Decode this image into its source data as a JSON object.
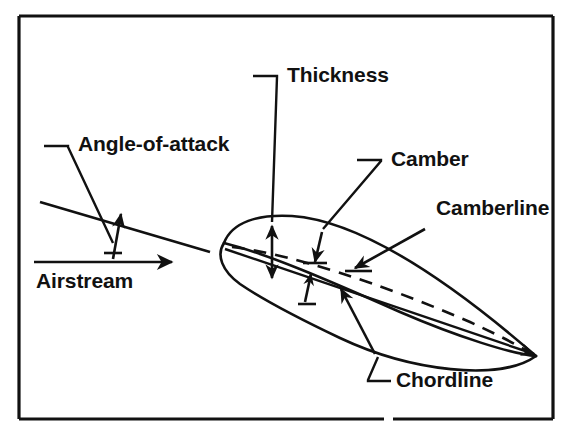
{
  "figure": {
    "background_color": "#ffffff",
    "ink_color": "#111111",
    "width": 571,
    "height": 446,
    "border": {
      "name": "figure-border",
      "x": 19,
      "y": 16,
      "width": 534,
      "height": 403,
      "stroke_width": 3.2,
      "bottom_gap_x": 384,
      "bottom_gap_width": 9
    }
  },
  "labels": {
    "angle_of_attack": {
      "text": "Angle-of-attack",
      "x": 78,
      "y": 151,
      "anchor": "start"
    },
    "airstream": {
      "text": "Airstream",
      "x": 36,
      "y": 288,
      "anchor": "start"
    },
    "thickness": {
      "text": "Thickness",
      "x": 287,
      "y": 82,
      "anchor": "start"
    },
    "camber": {
      "text": "Camber",
      "x": 391,
      "y": 166,
      "anchor": "start"
    },
    "camberline": {
      "text": "Camberline",
      "x": 436,
      "y": 215,
      "anchor": "start"
    },
    "chordline": {
      "text": "Chordline",
      "x": 396,
      "y": 387,
      "anchor": "start"
    }
  },
  "geometry": {
    "angle_of_attack_group": {
      "name": "angle-of-attack-construction",
      "inclined_chord_line": {
        "x1": 40,
        "y1": 202,
        "x2": 210,
        "y2": 252
      },
      "airstream_line": {
        "x1": 34,
        "y1": 262,
        "x2": 168,
        "y2": 262
      },
      "airstream_arrow_tip": {
        "x": 172,
        "y": 262
      },
      "angle_arrow": {
        "x1": 113,
        "y1": 259,
        "x2": 121,
        "y2": 214
      },
      "angle_arrow_base_tick": {
        "x1": 104,
        "y1": 253,
        "x2": 122,
        "y2": 253
      },
      "leader": "M 44,146 L 68,146 L 68,147 L 113,243"
    },
    "airfoil": {
      "name": "airfoil-section",
      "leading_edge": {
        "x": 224,
        "y": 243
      },
      "trailing_edge": {
        "x": 536,
        "y": 356
      },
      "upper_surface": "M 224,243 C 232,222 258,214 292,216 C 350,220 430,264 536,356",
      "nose_lower_loop": "M 224,243 C 216,255 222,271 240,284 C 262,299 300,319 340,338 C 410,371 500,382 536,356",
      "mid_body_line": "M 224,243 C 268,254 330,281 400,312 C 458,337 512,354 536,356",
      "chord_line": {
        "x1": 225,
        "y1": 249,
        "x2": 529,
        "y2": 352
      },
      "chord_arrow_tip": {
        "x": 534,
        "y": 354
      },
      "camber_line": "M 232,247 C 290,254 380,283 470,322 C 505,338 524,349 531,353"
    },
    "thickness_dimension": {
      "name": "thickness-dimension-arrow",
      "x": 272,
      "y_top": 226,
      "y_bottom": 278,
      "leader": "M 253,76 L 277,76 L 277,77 L 272,222"
    },
    "camber_dimension": {
      "name": "camber-dimension-arrow",
      "arrow_from": {
        "x": 322,
        "y": 232
      },
      "arrow_to": {
        "x": 315,
        "y": 262
      },
      "tick_bar": {
        "x1": 303,
        "y1": 263,
        "x2": 327,
        "y2": 263
      },
      "leader": "M 357,160 L 381,160 L 381,161 L 323,229"
    },
    "camberline_pointer": {
      "name": "camberline-pointer-arrow",
      "arrow_from": {
        "x": 425,
        "y": 229
      },
      "arrow_to": {
        "x": 355,
        "y": 268
      },
      "tick_bar": {
        "x1": 345,
        "y1": 271,
        "x2": 372,
        "y2": 271
      }
    },
    "chordline_dimension": {
      "name": "chordline-dimension-arrow",
      "arrow_from": {
        "x": 375,
        "y": 354
      },
      "arrow_to": {
        "x": 341,
        "y": 289
      },
      "small_tick_arrow": {
        "x1": 305,
        "y1": 302,
        "x2": 311,
        "y2": 274
      },
      "small_tick_bar": {
        "x1": 298,
        "y1": 304,
        "x2": 316,
        "y2": 304
      },
      "leader": "M 391,381 L 368,381 L 368,380 L 378,357"
    }
  },
  "legend_terms": [
    "Angle-of-attack",
    "Airstream",
    "Thickness",
    "Camber",
    "Camberline",
    "Chordline"
  ]
}
